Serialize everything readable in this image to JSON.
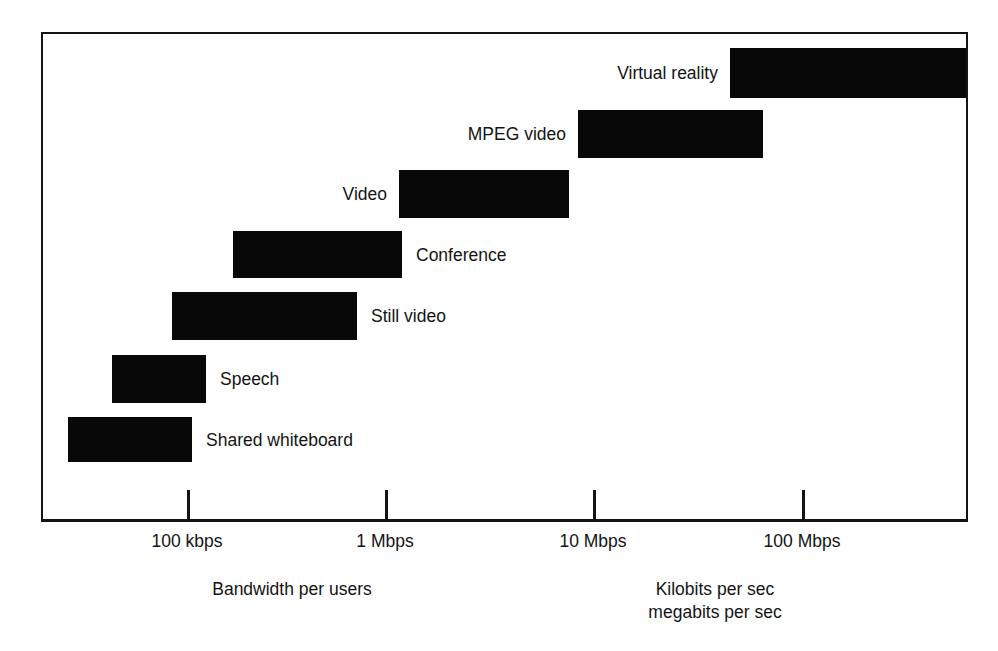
{
  "chart_data": {
    "type": "bar",
    "orientation": "horizontal-range",
    "title": "",
    "subtitle": "",
    "xlabel": "Bandwidth per users",
    "ylabel": "",
    "xscale": "log",
    "grid": false,
    "legend": null,
    "axis_ticks": [
      {
        "label": "100 kbps",
        "value_kbps": 100,
        "x_px": 187
      },
      {
        "label": "1 Mbps",
        "value_kbps": 1000,
        "x_px": 385
      },
      {
        "label": "10 Mbps",
        "value_kbps": 10000,
        "x_px": 593
      },
      {
        "label": "100 Mbps",
        "value_kbps": 100000,
        "x_px": 802
      }
    ],
    "xlim_kbps": [
      25,
      260000
    ],
    "categories": [
      "Virtual reality",
      "MPEG video",
      "Video",
      "Conference",
      "Still video",
      "Speech",
      "Shared whiteboard"
    ],
    "bars": [
      {
        "label": "Virtual reality",
        "label_side": "left",
        "start_kbps": 48000,
        "end_kbps": 260000,
        "x0_px": 730,
        "x1_px": 966,
        "y_px": 48,
        "height_px": 50
      },
      {
        "label": "MPEG video",
        "label_side": "left",
        "start_kbps": 8500,
        "end_kbps": 66000,
        "x0_px": 578,
        "x1_px": 763,
        "y_px": 110,
        "height_px": 48
      },
      {
        "label": "Video",
        "label_side": "left",
        "start_kbps": 1200,
        "end_kbps": 7800,
        "x0_px": 399,
        "x1_px": 569,
        "y_px": 170,
        "height_px": 48
      },
      {
        "label": "Conference",
        "label_side": "right",
        "start_kbps": 210,
        "end_kbps": 1350,
        "x0_px": 233,
        "x1_px": 402,
        "y_px": 231,
        "height_px": 47
      },
      {
        "label": "Still video",
        "label_side": "right",
        "start_kbps": 83,
        "end_kbps": 780,
        "x0_px": 172,
        "x1_px": 357,
        "y_px": 292,
        "height_px": 48
      },
      {
        "label": "Speech",
        "label_side": "right",
        "start_kbps": 37,
        "end_kbps": 160,
        "x0_px": 112,
        "x1_px": 206,
        "y_px": 355,
        "height_px": 48
      },
      {
        "label": "Shared whiteboard",
        "label_side": "right",
        "start_kbps": 26,
        "end_kbps": 125,
        "x0_px": 68,
        "x1_px": 192,
        "y_px": 417,
        "height_px": 45
      }
    ],
    "captions": {
      "left": "Bandwidth per users",
      "right": "Kilobits per sec\nmegabits per sec"
    },
    "colors": {
      "bar": "#080808",
      "frame": "#141414",
      "text": "#141414",
      "background": "#ffffff"
    }
  }
}
